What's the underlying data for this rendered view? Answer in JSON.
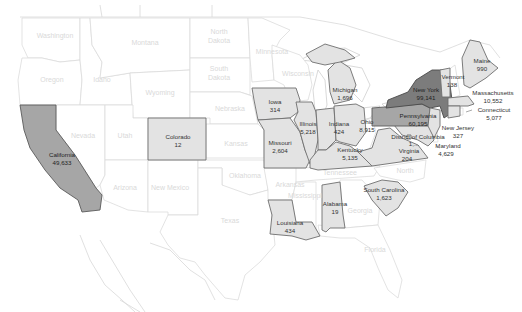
{
  "map": {
    "title": "",
    "type": "filled-choropleth",
    "region": "United States",
    "colors": {
      "no_data": "#ffffff",
      "low": "#e3e3e3",
      "mid": "#a6a6a6",
      "high": "#7c7c7c",
      "border_data": "#6e6e6e",
      "border_empty": "#dcdcdc"
    },
    "labeled_states": {
      "california": {
        "name": "California",
        "value": "49,633"
      },
      "colorado": {
        "name": "Colorado",
        "value": "12"
      },
      "iowa": {
        "name": "Iowa",
        "value": "314"
      },
      "missouri": {
        "name": "Missouri",
        "value": "2,604"
      },
      "illinois": {
        "name": "Illinois",
        "value": "5,218"
      },
      "indiana": {
        "name": "Indiana",
        "value": "424"
      },
      "michigan": {
        "name": "Michigan",
        "value": "1,696"
      },
      "ohio": {
        "name": "Ohio",
        "value": "8,915"
      },
      "kentucky": {
        "name": "Kentucky",
        "value": "5,135"
      },
      "louisiana": {
        "name": "Louisiana",
        "value": "434"
      },
      "alabama": {
        "name": "Alabama",
        "value": "19"
      },
      "south_carolina": {
        "name": "South Carolina",
        "value": "1,623"
      },
      "virginia": {
        "name": "Virginia",
        "value": "204"
      },
      "dc": {
        "name": "District of Columbia",
        "value": "1,..."
      },
      "maryland": {
        "name": "Maryland",
        "value": "4,629"
      },
      "pennsylvania": {
        "name": "Pennsylvania",
        "value": "60,195"
      },
      "new_york": {
        "name": "New York",
        "value": "99,141"
      },
      "new_jersey": {
        "name": "New Jersey",
        "value": "327"
      },
      "vermont": {
        "name": "Vermont",
        "value": "138"
      },
      "maine": {
        "name": "Maine",
        "value": "990"
      },
      "massachusetts": {
        "name": "Massachusetts",
        "value": "10,552"
      },
      "connecticut": {
        "name": "Connecticut",
        "value": "5,077"
      }
    },
    "unlabeled_states": {
      "washington": "Washington",
      "oregon": "Oregon",
      "idaho": "Idaho",
      "montana": "Montana",
      "wyoming": "Wyoming",
      "nevada": "Nevada",
      "utah": "Utah",
      "arizona": "Arizona",
      "new_mexico": "New Mexico",
      "north_dakota": "North Dakota",
      "south_dakota": "South Dakota",
      "nebraska": "Nebraska",
      "kansas": "Kansas",
      "oklahoma": "Oklahoma",
      "texas": "Texas",
      "minnesota": "Minnesota",
      "wisconsin": "Wisconsin",
      "arkansas": "Arkansas",
      "mississippi": "Mississippi",
      "tennessee": "Tennessee",
      "georgia": "Georgia",
      "florida": "Florida",
      "north_carolina": "North Carolina"
    }
  }
}
